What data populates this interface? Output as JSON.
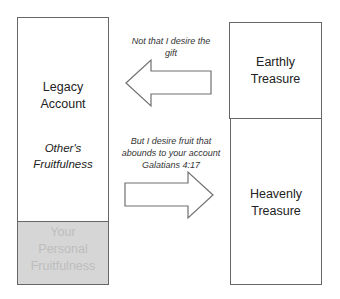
{
  "left_column": {
    "upper": {
      "title_line1": "Legacy",
      "title_line2": "Account",
      "subtitle_line1": "Other's",
      "subtitle_line2": "Fruitfulness"
    },
    "lower": {
      "line1": "Your",
      "line2": "Personal",
      "line3": "Fruitfulness",
      "fill_color": "#d6d6d6"
    }
  },
  "right_column": {
    "upper": {
      "line1": "Earthly",
      "line2": "Treasure"
    },
    "lower": {
      "line1": "Heavenly",
      "line2": "Treasure"
    }
  },
  "arrows": {
    "top": {
      "direction": "left",
      "caption_line1": "Not that I desire the",
      "caption_line2": "gift"
    },
    "bottom": {
      "direction": "right",
      "caption_line1": "But I desire fruit that",
      "caption_line2": "abounds to your account",
      "caption_line3": "Galatians 4:17"
    }
  }
}
